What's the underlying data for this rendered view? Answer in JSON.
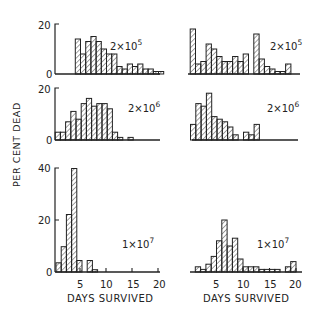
{
  "figure": {
    "ylabel": "PER CENT DEAD",
    "xlabel": "DAYS SURVIVED",
    "ink": "#222222",
    "background": "#ffffff"
  },
  "chart_data": [
    {
      "type": "bar",
      "panel": "top-left",
      "annotation": "2×10^5",
      "annotation_base": "2×10",
      "annotation_exp": "5",
      "xlabel": "",
      "ylabel": "PER CENT DEAD",
      "ylim": [
        0,
        20
      ],
      "yticks": [
        0,
        20
      ],
      "bin_width_days": 1,
      "x": [
        4,
        5,
        6,
        7,
        8,
        9,
        10,
        11,
        12,
        13,
        14,
        15,
        16,
        17,
        18,
        19,
        20
      ],
      "values": [
        14,
        8,
        13,
        15,
        13,
        10,
        8,
        8,
        3,
        2,
        4,
        3,
        4,
        2,
        2,
        1,
        0
      ],
      "extra_bins": [
        {
          "x": 20,
          "value": 1
        }
      ]
    },
    {
      "type": "bar",
      "panel": "top-right",
      "annotation": "2×10^5",
      "annotation_base": "2×10",
      "annotation_exp": "5",
      "xlabel": "",
      "ylabel": "",
      "ylim": [
        0,
        20
      ],
      "bin_width_days": 1,
      "x": [
        4,
        5,
        6,
        7,
        8,
        9,
        10,
        11,
        12,
        13,
        14,
        15,
        16,
        17,
        18,
        19,
        20
      ],
      "values": [
        18,
        4,
        5,
        12,
        10,
        7,
        5,
        5,
        7,
        5,
        8,
        0,
        16,
        6,
        3,
        2,
        1
      ],
      "extra_bins": [
        {
          "x": 21,
          "value": 1
        },
        {
          "x": 22,
          "value": 4
        }
      ]
    },
    {
      "type": "bar",
      "panel": "middle-left",
      "annotation": "2×10^6",
      "annotation_base": "2×10",
      "annotation_exp": "6",
      "xlabel": "",
      "ylabel": "PER CENT DEAD",
      "ylim": [
        0,
        20
      ],
      "yticks": [
        0,
        20
      ],
      "bin_width_days": 1,
      "x": [
        1,
        2,
        3,
        4,
        5,
        6,
        7,
        8,
        9,
        10,
        11,
        12,
        13,
        14,
        15,
        16,
        17,
        18,
        19
      ],
      "values": [
        3,
        3,
        7,
        11,
        8,
        14,
        16,
        13,
        14,
        14,
        12,
        3,
        1,
        0,
        1,
        0,
        0,
        0,
        0
      ]
    },
    {
      "type": "bar",
      "panel": "middle-right",
      "annotation": "2×10^6",
      "annotation_base": "2×10",
      "annotation_exp": "6",
      "xlabel": "",
      "ylabel": "",
      "ylim": [
        0,
        20
      ],
      "bin_width_days": 1,
      "x": [
        5,
        6,
        7,
        8,
        9,
        10,
        11,
        12,
        13,
        14,
        15,
        16,
        17,
        18
      ],
      "values": [
        6,
        14,
        13,
        18,
        9,
        8,
        7,
        5,
        2,
        0,
        3,
        2,
        6,
        0
      ]
    },
    {
      "type": "bar",
      "panel": "bottom-left",
      "annotation": "1×10^7",
      "annotation_base": "1×10",
      "annotation_exp": "7",
      "xlabel": "DAYS SURVIVED",
      "ylabel": "PER CENT DEAD",
      "ylim": [
        0,
        45
      ],
      "yticks": [
        0,
        20,
        40
      ],
      "xticks": [
        5,
        10,
        15,
        20
      ],
      "bin_width_days": 1,
      "x": [
        0,
        1,
        2,
        3,
        4,
        5,
        6,
        7,
        8
      ],
      "values": [
        4,
        11,
        25,
        45,
        5,
        0,
        5,
        1,
        0
      ]
    },
    {
      "type": "bar",
      "panel": "bottom-right",
      "annotation": "1×10^7",
      "annotation_base": "1×10",
      "annotation_exp": "7",
      "xlabel": "DAYS SURVIVED",
      "ylabel": "",
      "ylim": [
        0,
        45
      ],
      "xticks": [
        5,
        10,
        15,
        20
      ],
      "bin_width_days": 1,
      "x": [
        1,
        2,
        3,
        4,
        5,
        6,
        7,
        8,
        9,
        10,
        11,
        12,
        13,
        14,
        15,
        16,
        17,
        18,
        19,
        20
      ],
      "values": [
        2,
        1,
        3,
        6,
        12,
        20,
        10,
        13,
        5,
        2,
        2,
        2,
        1,
        1,
        1,
        1,
        0,
        2,
        4,
        0
      ]
    }
  ],
  "axes": {
    "left_x_ticks": [
      "5",
      "10",
      "15",
      "20"
    ],
    "right_x_ticks": [
      "5",
      "10",
      "15",
      "20"
    ],
    "row1_y_ticks": [
      "0",
      "20"
    ],
    "row2_y_ticks": [
      "0",
      "20"
    ],
    "row3_y_ticks": [
      "0",
      "20",
      "40"
    ]
  }
}
